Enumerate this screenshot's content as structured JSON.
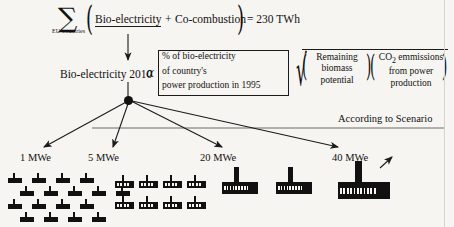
{
  "diagram": {
    "background_color": "#f7f5f1",
    "ink_color": "#111111"
  },
  "formula_row1": {
    "sigma": "∑",
    "sigma_subscript": "EU-countries",
    "paren_open": "(",
    "term_a": "Bio-electricity",
    "operator": "+",
    "term_b": "Co-combustion",
    "paren_close": ")",
    "equals_value": "= 230 TWh"
  },
  "formula_row2": {
    "left_label": "Bio-electricity 2010",
    "alpha": "α",
    "bracket_lines": [
      "% of bio-electricity",
      "of country's",
      "power production in 1995"
    ],
    "radical": "√",
    "group_remaining": [
      "Remaining",
      "biomass",
      "potential"
    ],
    "group_co2": [
      "CO",
      " emmissions",
      "from power",
      "production"
    ],
    "co2_subscript": "2",
    "paren": "("
  },
  "mid": {
    "scenario_note": "According to Scenario"
  },
  "capacity_groups": [
    {
      "label": "1 MWe",
      "size": "small",
      "count": 17,
      "rows": [
        4,
        5,
        4,
        4
      ]
    },
    {
      "label": "5 MWe",
      "size": "medium",
      "count": 8,
      "rows": [
        4,
        4
      ]
    },
    {
      "label": "20 MWe",
      "size": "large",
      "count": 2,
      "rows": [
        2
      ]
    },
    {
      "label": "40 MWe",
      "size": "xlarge",
      "count": 1,
      "rows": [
        1
      ]
    }
  ]
}
